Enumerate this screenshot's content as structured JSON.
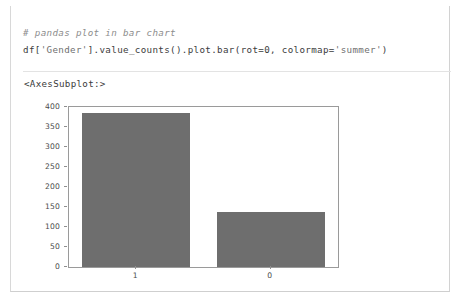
{
  "cell": {
    "code_comment": "# pandas plot in bar chart",
    "code_line": "df['Gender'].value_counts().plot.bar(rot=0, colormap='summer')",
    "code_tokens": {
      "part1": "df[",
      "str1": "'Gender'",
      "part2": "].value_counts().plot.bar(rot=0, colormap=",
      "str2": "'summer'",
      "part3": ")"
    },
    "output_text": "<AxesSubplot:>"
  },
  "chart_data": {
    "type": "bar",
    "title": "",
    "xlabel": "",
    "ylabel": "",
    "categories": [
      "1",
      "0"
    ],
    "values": [
      386,
      137
    ],
    "ylim": [
      0,
      400
    ],
    "yticks": [
      0,
      50,
      100,
      150,
      200,
      250,
      300,
      350,
      400
    ],
    "ytick_labels": [
      "0",
      "50",
      "100",
      "150",
      "200",
      "250",
      "300",
      "350",
      "400"
    ],
    "grid": false,
    "legend": false,
    "bar_color": "#6e6e6e",
    "frame_color": "#9a9a9a"
  }
}
